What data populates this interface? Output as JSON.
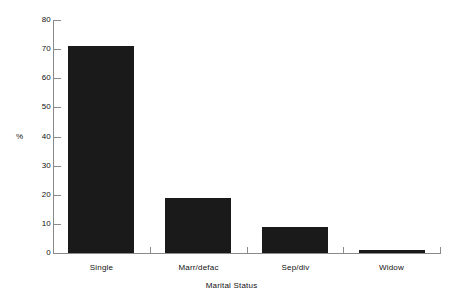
{
  "chart_data": {
    "type": "bar",
    "title": "",
    "subtitle": "",
    "categories": [
      "Single",
      "Marr/defac",
      "Sep/div",
      "Widow"
    ],
    "values": [
      71,
      19,
      9,
      1
    ],
    "xlabel": "Marital Status",
    "ylabel": "%",
    "ylim": [
      0,
      80
    ],
    "yticks": [
      0,
      10,
      20,
      30,
      40,
      50,
      60,
      70,
      80
    ],
    "ytick_labels": [
      "0",
      "10",
      "20",
      "30",
      "40",
      "50",
      "60",
      "70",
      "80"
    ],
    "grid": false,
    "legend": false,
    "legend_position": "none",
    "bar_color": "#1a1a1a",
    "background_color": "#ffffff",
    "axis_color": "#8a8a8a"
  },
  "axes": {
    "y_title": "%",
    "x_title": "Marital Status"
  }
}
